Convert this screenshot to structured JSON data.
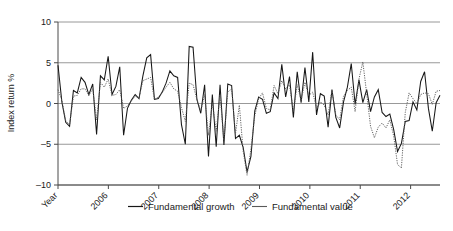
{
  "chart_data": {
    "type": "line",
    "title": "",
    "xlabel": "Year",
    "ylabel": "Index return %",
    "ylim": [
      -10,
      10
    ],
    "yticks": [
      -10,
      -5,
      0,
      5,
      10
    ],
    "ytick_labels": [
      "–10",
      "–5",
      "0",
      "5",
      "10"
    ],
    "xtick_labels": [
      "Year",
      "2006",
      "2007",
      "2008",
      "2009",
      "2010",
      "2011",
      "2012"
    ],
    "xtick_positions": [
      0,
      12,
      24,
      36,
      48,
      60,
      72,
      84
    ],
    "grid": true,
    "grid_axis": "y",
    "legend_position": "bottom",
    "x_axis_note": "Monthly observations, origin at 2005 running to mid-2012",
    "n_points": 91,
    "series": [
      {
        "name": "Fundamental growth",
        "style": "solid",
        "color": "#171717",
        "values": [
          4.7,
          0.2,
          -2.3,
          -2.8,
          1.6,
          1.3,
          3.2,
          2.6,
          1.1,
          2.4,
          -3.8,
          3.4,
          2.9,
          5.8,
          1.1,
          2.1,
          4.5,
          -3.9,
          -0.6,
          0.4,
          1.1,
          0.6,
          3.4,
          5.6,
          6.0,
          0.5,
          0.6,
          1.4,
          2.5,
          4.0,
          3.4,
          3.2,
          -2.6,
          -5.0,
          7.0,
          6.9,
          0.5,
          -1.2,
          2.3,
          -6.5,
          1.1,
          -5.3,
          2.3,
          -5.1,
          2.4,
          2.2,
          -4.3,
          -3.9,
          -5.4,
          -8.4,
          -6.5,
          -0.9,
          0.8,
          0.5,
          -1.2,
          -1.0,
          1.3,
          0.6,
          4.8,
          0.8,
          3.3,
          -1.7,
          3.9,
          0.1,
          4.4,
          0.2,
          6.3,
          -1.4,
          1.2,
          0.9,
          -2.9,
          1.7,
          -1.7,
          -3.0,
          0.2,
          2.0,
          4.9,
          -0.1,
          2.9,
          0.1,
          1.7,
          -1.0,
          0.8,
          1.7,
          -1.1,
          -1.6,
          -1.3,
          -3.2,
          -5.9,
          -4.9,
          -2.2,
          -2.1,
          0.2,
          -0.8,
          2.7,
          3.9,
          -0.6,
          -3.4,
          0.1,
          1.0
        ]
      },
      {
        "name": "Fundamental value",
        "style": "dotted",
        "color": "#5a5a5a",
        "values": [
          1.7,
          0.4,
          -2.1,
          -2.6,
          0.9,
          1.0,
          1.8,
          1.8,
          1.0,
          1.8,
          -2.0,
          2.6,
          2.0,
          3.0,
          1.0,
          1.1,
          1.7,
          -0.6,
          -0.3,
          0.3,
          0.9,
          0.7,
          2.8,
          3.0,
          3.2,
          0.5,
          0.8,
          1.3,
          2.0,
          2.6,
          1.8,
          1.5,
          -0.5,
          -2.2,
          2.5,
          2.3,
          0.5,
          -0.9,
          1.1,
          -3.9,
          0.1,
          -3.4,
          1.0,
          -4.5,
          1.4,
          1.8,
          -3.7,
          -0.2,
          -5.9,
          -8.8,
          -5.6,
          -1.5,
          0.6,
          1.3,
          -0.6,
          -0.8,
          2.2,
          1.2,
          2.8,
          1.8,
          2.3,
          -1.0,
          2.3,
          0.4,
          2.6,
          1.0,
          1.4,
          -0.6,
          0.2,
          -0.2,
          -1.4,
          1.6,
          -1.4,
          -2.0,
          0.9,
          1.6,
          2.0,
          -1.0,
          3.0,
          5.1,
          1.2,
          -2.8,
          -4.2,
          -2.9,
          -2.4,
          -3.0,
          -2.0,
          -4.0,
          -7.5,
          -7.9,
          -1.1,
          1.3,
          0.6,
          0.0,
          1.1,
          1.3,
          1.2,
          -0.1,
          1.5,
          1.6
        ]
      }
    ]
  },
  "legend": {
    "items": [
      {
        "label": "Fundamental growth",
        "style": "solid"
      },
      {
        "label": "Fundamental value",
        "style": "dotted"
      }
    ]
  }
}
